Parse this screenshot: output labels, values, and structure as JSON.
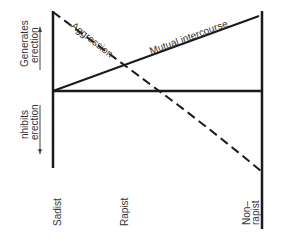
{
  "diagram": {
    "y_axis": {
      "upper_label": [
        "Generates",
        "erection"
      ],
      "lower_label": [
        "nhibits",
        "erection"
      ],
      "upper_arrow": "arrow-up",
      "lower_arrow": "arrow-down"
    },
    "x_categories": [
      {
        "label": "Sadist"
      },
      {
        "label": "Rapist"
      },
      {
        "label_lines": [
          "Non–",
          "rapist"
        ]
      }
    ],
    "lines": [
      {
        "name": "Aggression",
        "style": "dashed",
        "from": "Sadist high (generates erection)",
        "to": "Non-rapist low (inhibits erection)"
      },
      {
        "name": "Mutual intercourse",
        "style": "solid",
        "from": "Sadist neutral",
        "to": "Non-rapist high (generates erection)"
      }
    ],
    "baseline": "neutral",
    "colors": {
      "line": "#1a1a1a",
      "text": "#333333",
      "background": "#ffffff"
    }
  }
}
